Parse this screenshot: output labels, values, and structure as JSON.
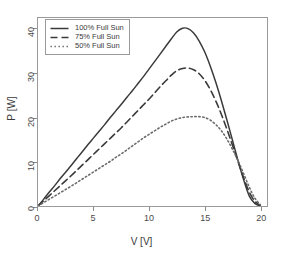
{
  "chart_data": {
    "type": "line",
    "title": "",
    "xlabel": "V [V]",
    "ylabel": "P [W]",
    "xlim": [
      0,
      20.6
    ],
    "ylim": [
      0,
      42.5
    ],
    "xticks": [
      "0",
      "5",
      "10",
      "15",
      "20"
    ],
    "xtick_values": [
      0,
      5,
      10,
      15,
      20
    ],
    "yticks": [
      "0",
      "10",
      "20",
      "30",
      "40"
    ],
    "ytick_values": [
      0,
      10,
      20,
      30,
      40
    ],
    "grid": false,
    "legend_position": "upper left",
    "series": [
      {
        "name": "100% Full Sun",
        "style": "solid",
        "color": "#3a3a3a",
        "peak_v": 13.0,
        "peak_p": 40.2,
        "x": [
          0.0,
          0.5,
          1.0,
          1.5,
          2.0,
          2.5,
          3.0,
          3.5,
          4.0,
          4.5,
          5.0,
          5.5,
          6.0,
          6.5,
          7.0,
          7.5,
          8.0,
          8.5,
          9.0,
          9.5,
          10.0,
          10.5,
          11.0,
          11.5,
          12.0,
          12.5,
          13.0,
          13.5,
          14.0,
          14.5,
          15.0,
          15.5,
          16.0,
          16.5,
          17.0,
          17.5,
          18.0,
          18.5,
          19.0,
          19.5,
          20.0
        ],
        "values": [
          0.0,
          1.5,
          3.1,
          4.6,
          6.2,
          7.7,
          9.2,
          10.8,
          12.3,
          13.9,
          15.4,
          16.9,
          18.4,
          20.0,
          21.5,
          23.0,
          24.6,
          26.1,
          27.7,
          29.3,
          31.0,
          32.7,
          34.4,
          36.1,
          37.8,
          39.4,
          40.2,
          40.1,
          39.1,
          37.3,
          34.8,
          31.6,
          27.9,
          23.8,
          19.4,
          14.8,
          10.2,
          5.9,
          2.3,
          0.6,
          0.0
        ]
      },
      {
        "name": "75% Full Sun",
        "style": "dashed",
        "color": "#3a3a3a",
        "peak_v": 13.6,
        "peak_p": 31.2,
        "x": [
          0.0,
          0.5,
          1.0,
          1.5,
          2.0,
          2.5,
          3.0,
          3.5,
          4.0,
          4.5,
          5.0,
          5.5,
          6.0,
          6.5,
          7.0,
          7.5,
          8.0,
          8.5,
          9.0,
          9.5,
          10.0,
          10.5,
          11.0,
          11.5,
          12.0,
          12.5,
          13.0,
          13.5,
          14.0,
          14.5,
          15.0,
          15.5,
          16.0,
          16.5,
          17.0,
          17.5,
          18.0,
          18.5,
          19.0,
          19.5,
          20.0
        ],
        "values": [
          0.0,
          1.15,
          2.3,
          3.45,
          4.6,
          5.75,
          6.9,
          8.1,
          9.3,
          10.5,
          11.7,
          12.9,
          14.1,
          15.3,
          16.5,
          17.7,
          19.0,
          20.3,
          21.6,
          22.9,
          24.2,
          25.6,
          27.0,
          28.3,
          29.6,
          30.6,
          31.1,
          31.2,
          30.8,
          29.9,
          28.4,
          26.3,
          23.7,
          20.7,
          17.3,
          13.7,
          10.0,
          6.4,
          3.2,
          1.1,
          0.1
        ]
      },
      {
        "name": "50% Full Sun",
        "style": "dotted",
        "color": "#6a6a6a",
        "peak_v": 14.6,
        "peak_p": 20.2,
        "x": [
          0.0,
          0.5,
          1.0,
          1.5,
          2.0,
          2.5,
          3.0,
          3.5,
          4.0,
          4.5,
          5.0,
          5.5,
          6.0,
          6.5,
          7.0,
          7.5,
          8.0,
          8.5,
          9.0,
          9.5,
          10.0,
          10.5,
          11.0,
          11.5,
          12.0,
          12.5,
          13.0,
          13.5,
          14.0,
          14.5,
          15.0,
          15.5,
          16.0,
          16.5,
          17.0,
          17.5,
          18.0,
          18.5,
          19.0,
          19.5,
          20.0
        ],
        "values": [
          0.0,
          0.75,
          1.5,
          2.25,
          3.0,
          3.75,
          4.5,
          5.3,
          6.1,
          6.9,
          7.7,
          8.5,
          9.3,
          10.1,
          11.0,
          11.8,
          12.7,
          13.6,
          14.5,
          15.4,
          16.2,
          17.0,
          17.8,
          18.5,
          19.2,
          19.7,
          20.0,
          20.15,
          20.2,
          20.2,
          20.0,
          19.4,
          18.4,
          17.0,
          15.1,
          12.8,
          10.2,
          7.3,
          4.3,
          1.8,
          0.3
        ]
      }
    ],
    "legend_entries": [
      {
        "label": "100% Full Sun",
        "style": "solid"
      },
      {
        "label": "75% Full Sun",
        "style": "dashed"
      },
      {
        "label": "50% Full Sun",
        "style": "dotted"
      }
    ]
  }
}
